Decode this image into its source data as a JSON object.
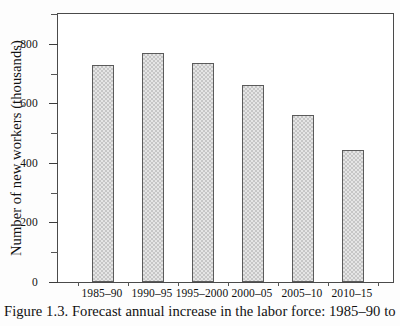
{
  "caption": "Figure 1.3. Forecast annual increase in the labor force: 1985–90 to",
  "chart_data": {
    "type": "bar",
    "title": "",
    "xlabel": "",
    "ylabel": "Number of new workers (thousands)",
    "categories": [
      "1985–90",
      "1990–95",
      "1995–2000",
      "2000–05",
      "2005–10",
      "2010–15"
    ],
    "values": [
      730,
      770,
      735,
      660,
      560,
      445
    ],
    "ylim": [
      0,
      900
    ],
    "yticks": [
      0,
      200,
      400,
      600,
      800
    ],
    "ytick_labels": [
      "0",
      "200",
      "400",
      "600",
      "800"
    ],
    "yminor_ticks": [
      100,
      300,
      500,
      700,
      900
    ],
    "grid": false,
    "legend": "none",
    "bar_color": "#c6c6c6",
    "bar_edge_color": "#5b5b5b",
    "axis_color": "#4a4a4a"
  }
}
